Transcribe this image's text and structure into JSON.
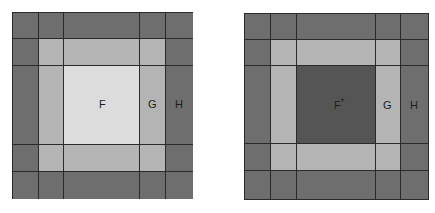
{
  "left_panel": {
    "labels": {
      "center": "F",
      "ring": "G",
      "outer": "H"
    }
  },
  "right_panel": {
    "labels": {
      "center": "F",
      "center_sup": "*",
      "ring": "G",
      "outer": "H"
    }
  },
  "colors": {
    "outer": "#6e6e6e",
    "ring": "#b4b4b4",
    "center_light": "#dcdcdc",
    "center_dark": "#555555",
    "gridline": "#2a2a2a"
  }
}
